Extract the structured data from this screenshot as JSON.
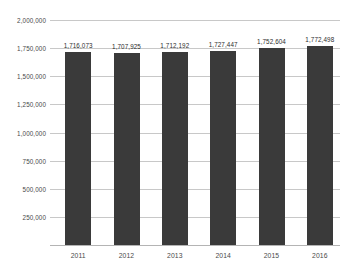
{
  "chart_data": {
    "type": "bar",
    "title": "",
    "subtitle": "",
    "xlabel": "",
    "ylabel": "",
    "categories": [
      "2011",
      "2012",
      "2013",
      "2014",
      "2015",
      "2016"
    ],
    "values": [
      1716073,
      1707925,
      1712192,
      1727447,
      1752604,
      1772498
    ],
    "value_labels": [
      "1,716,073",
      "1,707,925",
      "1,712,192",
      "1,727,447",
      "1,752,604",
      "1,772,498"
    ],
    "series": [
      {
        "name": "",
        "values": [
          1716073,
          1707925,
          1712192,
          1727447,
          1752604,
          1772498
        ]
      }
    ],
    "ylim": [
      0,
      2000000
    ],
    "ytick_values": [
      250000,
      500000,
      750000,
      1000000,
      1250000,
      1500000,
      1750000,
      2000000
    ],
    "ytick_labels": [
      "250,000",
      "500,000",
      "750,000",
      "1,000,000",
      "1,250,000",
      "1,500,000",
      "1,750,000",
      "2,000,000"
    ],
    "grid": true,
    "legend": false,
    "legend_position": "none",
    "bar_color": "#3a3a3a",
    "gridline_color": "#c8c8c8",
    "axis_color": "#b4b4b4",
    "label_color": "#4a4a4a",
    "background": "#ffffff"
  }
}
